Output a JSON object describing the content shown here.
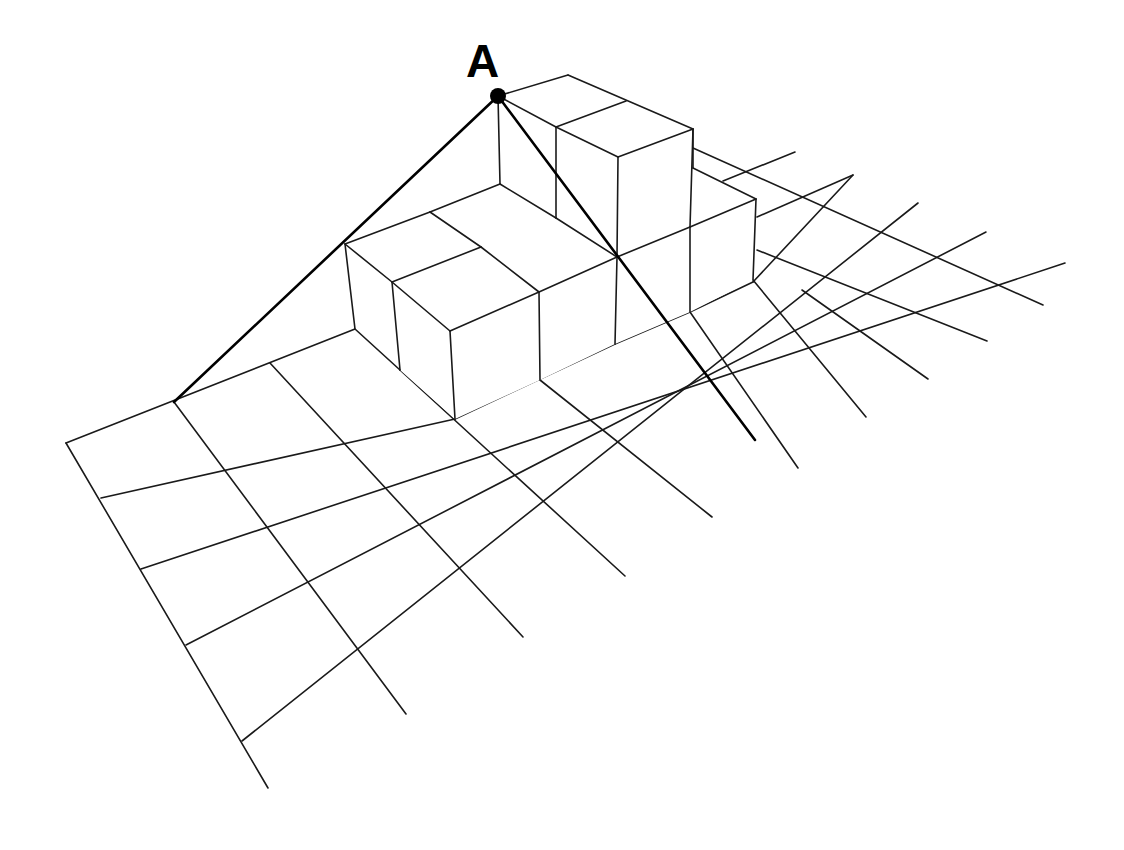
{
  "diagram": {
    "point_label": "A",
    "point": {
      "x": 498,
      "y": 96,
      "r": 8
    },
    "label_pos": {
      "x": 466,
      "y": 38
    },
    "colors": {
      "stroke": "#1a1a1a",
      "background": "#ffffff",
      "point": "#000000"
    },
    "grid_rows": [
      [
        [
          66,
          443
        ],
        [
          355,
          329
        ]
      ],
      [
        [
          101,
          498
        ],
        [
          455,
          419
        ]
      ],
      [
        [
          455,
          419
        ],
        [
          540,
          380
        ]
      ],
      [
        [
          540,
          380
        ],
        [
          615,
          344
        ]
      ],
      [
        [
          615,
          344
        ],
        [
          690,
          312
        ]
      ],
      [
        [
          690,
          312
        ],
        [
          755,
          284
        ]
      ],
      [
        [
          755,
          284
        ],
        [
          1065,
          263
        ]
      ],
      [
        [
          141,
          569
        ],
        [
          1065,
          263
        ]
      ],
      [
        [
          186,
          645
        ],
        [
          986,
          232
        ]
      ],
      [
        [
          242,
          741
        ],
        [
          918,
          203
        ]
      ]
    ],
    "segments": {
      "ground_rows": [
        [
          [
            66,
            443
          ],
          [
            355,
            329
          ]
        ],
        [
          [
            101,
            498
          ],
          [
            455,
            419
          ]
        ],
        [
          [
            455,
            419
          ],
          [
            615,
            344
          ]
        ],
        [
          [
            615,
            344
          ],
          [
            690,
            312
          ]
        ],
        [
          [
            690,
            312
          ],
          [
            753,
            282
          ]
        ],
        [
          [
            753,
            282
          ],
          [
            853,
            175
          ]
        ],
        [
          [
            141,
            569
          ],
          [
            1065,
            263
          ]
        ],
        [
          [
            186,
            645
          ],
          [
            986,
            232
          ]
        ],
        [
          [
            242,
            741
          ],
          [
            918,
            203
          ]
        ],
        [
          [
            723,
            181
          ],
          [
            795,
            152
          ]
        ],
        [
          [
            757,
            217
          ],
          [
            853,
            175
          ]
        ]
      ],
      "ground_cols": [
        [
          [
            66,
            443
          ],
          [
            268,
            788
          ]
        ],
        [
          [
            174,
            402
          ],
          [
            406,
            714
          ]
        ],
        [
          [
            270,
            363
          ],
          [
            523,
            637
          ]
        ],
        [
          [
            400,
            370
          ],
          [
            625,
            576
          ]
        ],
        [
          [
            540,
            380
          ],
          [
            712,
            517
          ]
        ],
        [
          [
            690,
            312
          ],
          [
            798,
            468
          ]
        ],
        [
          [
            753,
            280
          ],
          [
            866,
            417
          ]
        ],
        [
          [
            693,
            148
          ],
          [
            1043,
            305
          ]
        ],
        [
          [
            757,
            250
          ],
          [
            987,
            341
          ]
        ],
        [
          [
            802,
            290
          ],
          [
            928,
            379
          ]
        ]
      ],
      "cube_edges": [
        [
          [
            355,
            329
          ],
          [
            400,
            370
          ]
        ],
        [
          [
            345,
            244
          ],
          [
            355,
            329
          ]
        ],
        [
          [
            392,
            282
          ],
          [
            400,
            370
          ]
        ],
        [
          [
            450,
            331
          ],
          [
            455,
            419
          ]
        ],
        [
          [
            345,
            244
          ],
          [
            392,
            282
          ]
        ],
        [
          [
            392,
            282
          ],
          [
            450,
            331
          ]
        ],
        [
          [
            345,
            244
          ],
          [
            430,
            212
          ]
        ],
        [
          [
            430,
            212
          ],
          [
            500,
            184
          ]
        ],
        [
          [
            392,
            282
          ],
          [
            481,
            247
          ]
        ],
        [
          [
            450,
            331
          ],
          [
            539,
            292
          ]
        ],
        [
          [
            481,
            247
          ],
          [
            539,
            292
          ]
        ],
        [
          [
            430,
            212
          ],
          [
            481,
            247
          ]
        ],
        [
          [
            500,
            184
          ],
          [
            556,
            218
          ]
        ],
        [
          [
            539,
            292
          ],
          [
            617,
            257
          ]
        ],
        [
          [
            539,
            292
          ],
          [
            540,
            380
          ]
        ],
        [
          [
            617,
            257
          ],
          [
            615,
            344
          ]
        ],
        [
          [
            556,
            218
          ],
          [
            617,
            257
          ]
        ],
        [
          [
            617,
            257
          ],
          [
            690,
            227
          ]
        ],
        [
          [
            690,
            227
          ],
          [
            756,
            199
          ]
        ],
        [
          [
            690,
            227
          ],
          [
            690,
            312
          ]
        ],
        [
          [
            756,
            199
          ],
          [
            753,
            280
          ]
        ],
        [
          [
            693,
            168
          ],
          [
            756,
            199
          ]
        ],
        [
          [
            498,
            96
          ],
          [
            500,
            184
          ]
        ],
        [
          [
            498,
            96
          ],
          [
            568,
            75
          ]
        ],
        [
          [
            568,
            75
          ],
          [
            693,
            129
          ]
        ],
        [
          [
            498,
            96
          ],
          [
            556,
            127
          ]
        ],
        [
          [
            556,
            127
          ],
          [
            626,
            101
          ]
        ],
        [
          [
            556,
            127
          ],
          [
            618,
            157
          ]
        ],
        [
          [
            618,
            157
          ],
          [
            693,
            129
          ]
        ],
        [
          [
            556,
            127
          ],
          [
            556,
            218
          ]
        ],
        [
          [
            618,
            157
          ],
          [
            617,
            257
          ]
        ],
        [
          [
            693,
            129
          ],
          [
            690,
            227
          ]
        ],
        [
          [
            693,
            129
          ],
          [
            693,
            168
          ]
        ]
      ],
      "sight_lines": [
        [
          [
            498,
            96
          ],
          [
            174,
            402
          ]
        ],
        [
          [
            498,
            96
          ],
          [
            755,
            440
          ]
        ]
      ]
    }
  }
}
